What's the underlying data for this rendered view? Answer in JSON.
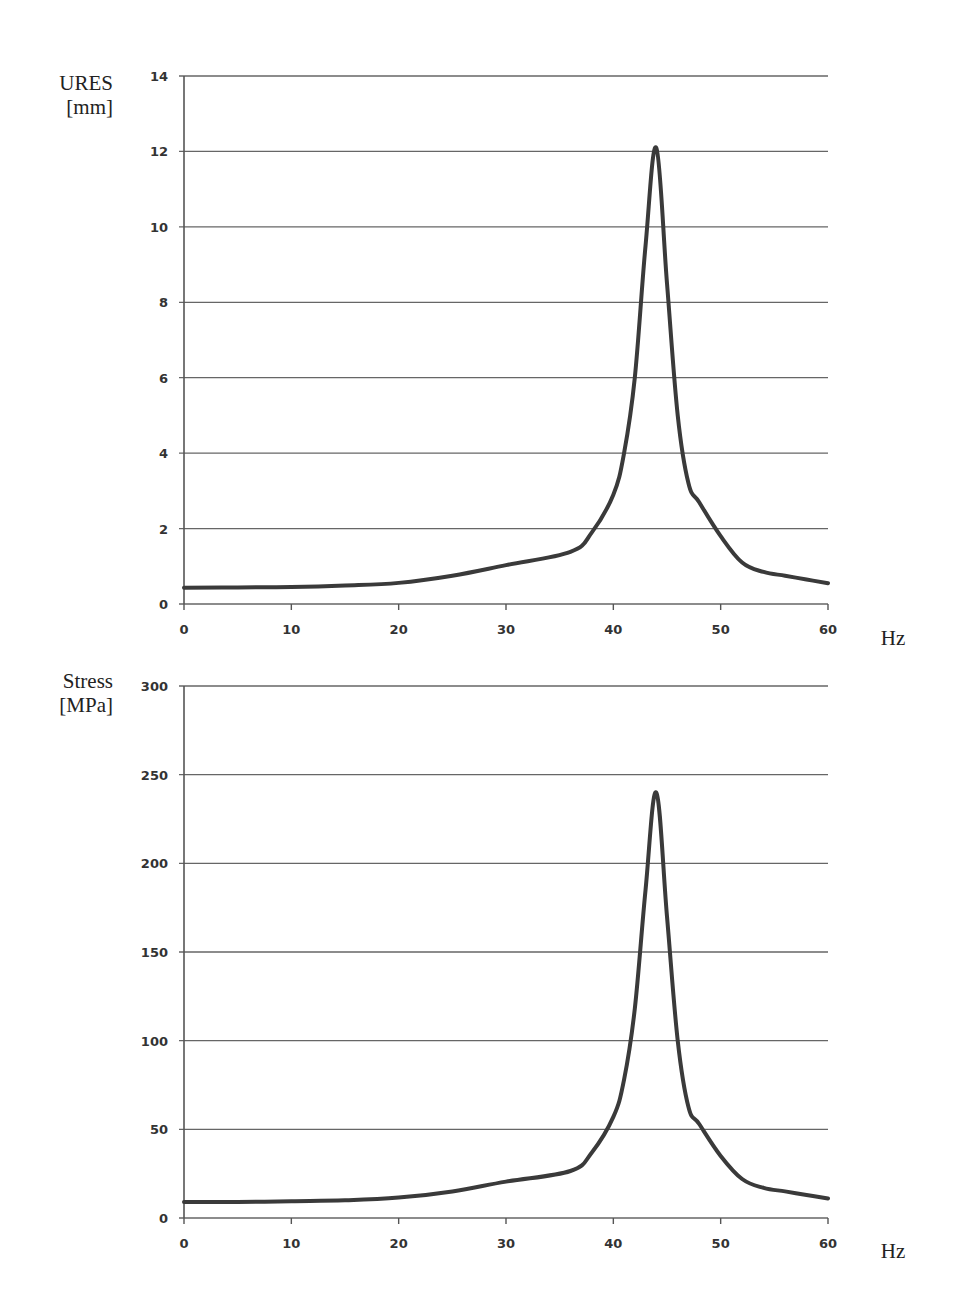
{
  "chart_data": [
    {
      "type": "line",
      "title": "",
      "xlabel": "Hz",
      "ylabel": "URES [mm]",
      "ylabel_lines": [
        "URES",
        "[mm]"
      ],
      "xlim": [
        0,
        60
      ],
      "ylim": [
        0,
        14
      ],
      "x_ticks": [
        0,
        10,
        20,
        30,
        40,
        50,
        60
      ],
      "y_ticks": [
        0,
        2,
        4,
        6,
        8,
        10,
        12,
        14
      ],
      "grid": "horizontal",
      "legend": null,
      "series": [
        {
          "name": "URES",
          "x": [
            0,
            5,
            10,
            15,
            20,
            25,
            30,
            36,
            38,
            40,
            41,
            42,
            43,
            44,
            45,
            46,
            47,
            48,
            50,
            52,
            54,
            56,
            58,
            60
          ],
          "values": [
            0.43,
            0.44,
            0.45,
            0.49,
            0.56,
            0.75,
            1.03,
            1.38,
            1.9,
            2.9,
            4.0,
            6.0,
            9.5,
            12.1,
            8.5,
            5.0,
            3.2,
            2.7,
            1.8,
            1.1,
            0.85,
            0.75,
            0.65,
            0.55
          ]
        }
      ]
    },
    {
      "type": "line",
      "title": "",
      "xlabel": "Hz",
      "ylabel": "Stress [MPa]",
      "ylabel_lines": [
        "Stress",
        "[MPa]"
      ],
      "xlim": [
        0,
        60
      ],
      "ylim": [
        0,
        300
      ],
      "x_ticks": [
        0,
        10,
        20,
        30,
        40,
        50,
        60
      ],
      "y_ticks": [
        0,
        50,
        100,
        150,
        200,
        250,
        300
      ],
      "grid": "horizontal",
      "legend": null,
      "series": [
        {
          "name": "Stress",
          "x": [
            0,
            5,
            10,
            15,
            20,
            25,
            30,
            36,
            38,
            40,
            41,
            42,
            43,
            44,
            45,
            46,
            47,
            48,
            50,
            52,
            54,
            56,
            58,
            60
          ],
          "values": [
            9,
            9,
            9.5,
            10,
            11.5,
            15,
            20.5,
            26.5,
            37,
            57,
            78,
            118,
            185,
            240,
            170,
            100,
            62.6,
            53,
            35,
            22,
            17,
            15,
            13,
            11
          ]
        }
      ]
    }
  ]
}
